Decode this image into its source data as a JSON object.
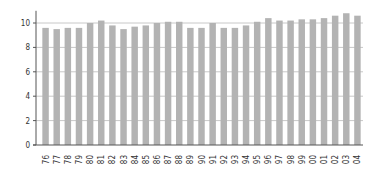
{
  "chart_data": {
    "type": "bar",
    "title": "",
    "xlabel": "",
    "ylabel": "",
    "ylim": [
      0,
      11
    ],
    "yticks": [
      0,
      2,
      4,
      6,
      8,
      10
    ],
    "grid": true,
    "legend": null,
    "bar_color": "#b3b3b3",
    "categories": [
      "76",
      "77",
      "78",
      "79",
      "80",
      "81",
      "82",
      "83",
      "84",
      "85",
      "86",
      "87",
      "88",
      "89",
      "90",
      "91",
      "92",
      "93",
      "94",
      "95",
      "96",
      "97",
      "98",
      "99",
      "00",
      "01",
      "02",
      "03",
      "04"
    ],
    "values": [
      9.6,
      9.5,
      9.6,
      9.6,
      10.0,
      10.2,
      9.8,
      9.5,
      9.7,
      9.8,
      10.0,
      10.1,
      10.1,
      9.6,
      9.6,
      10.0,
      9.6,
      9.6,
      9.8,
      10.1,
      10.4,
      10.2,
      10.2,
      10.3,
      10.3,
      10.4,
      10.6,
      10.8,
      10.6
    ]
  }
}
